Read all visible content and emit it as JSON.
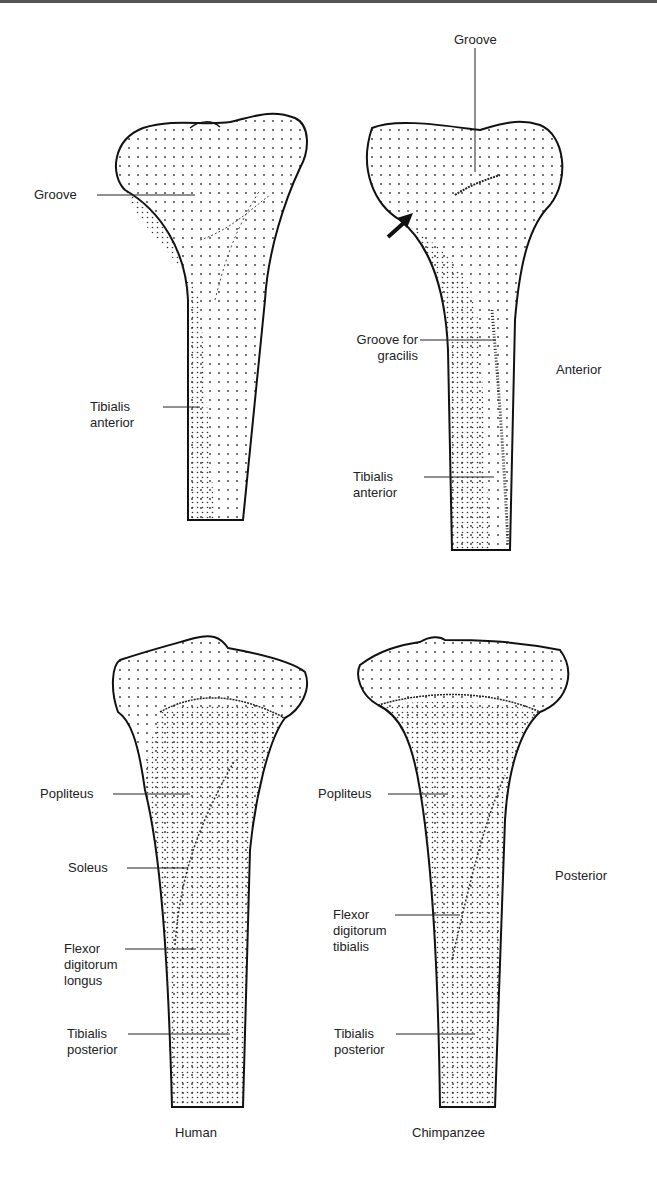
{
  "figure": {
    "columns": [
      "Human",
      "Chimpanzee"
    ],
    "rows": [
      "Anterior",
      "Posterior"
    ],
    "panels": {
      "human_anterior": {
        "labels": [
          {
            "id": "groove",
            "text": "Groove"
          },
          {
            "id": "tibialis_anterior",
            "text": "Tibialis\nanterior"
          }
        ]
      },
      "chimp_anterior": {
        "labels": [
          {
            "id": "groove",
            "text": "Groove"
          },
          {
            "id": "groove_gracilis",
            "text": "Groove for\ngracilis"
          },
          {
            "id": "tibialis_anterior",
            "text": "Tibialis\nanterior"
          }
        ],
        "arrow": "arrow-pointing-to-medial-condyle"
      },
      "human_posterior": {
        "labels": [
          {
            "id": "popliteus",
            "text": "Popliteus"
          },
          {
            "id": "soleus",
            "text": "Soleus"
          },
          {
            "id": "fdl",
            "text": "Flexor\ndigitorum\nlongus"
          },
          {
            "id": "tibialis_posterior",
            "text": "Tibialis\nposterior"
          }
        ]
      },
      "chimp_posterior": {
        "labels": [
          {
            "id": "popliteus",
            "text": "Popliteus"
          },
          {
            "id": "fdt",
            "text": "Flexor\ndigitorum\ntibialis"
          },
          {
            "id": "tibialis_posterior",
            "text": "Tibialis\nposterior"
          }
        ]
      }
    },
    "view_labels": {
      "anterior": "Anterior",
      "posterior": "Posterior"
    },
    "captions": {
      "human": "Human",
      "chimp": "Chimpanzee"
    }
  }
}
